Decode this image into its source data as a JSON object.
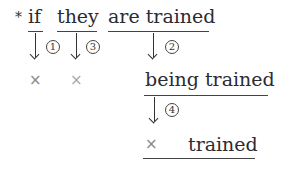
{
  "diagram": {
    "marker": "*",
    "top_row": [
      {
        "id": "if",
        "text": "if"
      },
      {
        "id": "they",
        "text": "they"
      },
      {
        "id": "are_trained",
        "text": "are trained"
      }
    ],
    "steps": {
      "one": "1",
      "two": "2",
      "three": "3",
      "four": "4"
    },
    "results": {
      "if_result": "×",
      "they_result": "×",
      "middle": "being trained",
      "final_cross": "×",
      "final_word": "trained"
    }
  }
}
